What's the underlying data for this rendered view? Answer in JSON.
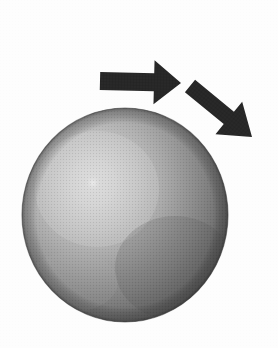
{
  "figure": {
    "title": "Shaded sphere with incoming and outgoing arrows",
    "background_color": "#fdfdfd",
    "canvas": {
      "width": 278,
      "height": 348
    }
  },
  "sphere": {
    "name": "shaded-sphere",
    "center_x": 125,
    "center_y": 215,
    "radius_x": 103,
    "radius_y": 107,
    "bounds": {
      "left": 22,
      "top": 108,
      "right": 228,
      "bottom": 322
    },
    "highlight": {
      "center_x": 93,
      "center_y": 183,
      "radius": 7,
      "color": "#e8e8e8"
    },
    "light_direction": "upper-left",
    "colors": {
      "highlight": "#d8d8d8",
      "midtone": "#9a9a9a",
      "shadow": "#6a6a6a",
      "terminator": "#4a4a4a",
      "rim": "#3c3c3c"
    },
    "texture": "halftone-screen"
  },
  "arrows": [
    {
      "name": "incoming-arrow",
      "direction": "right",
      "angle_degrees": 0,
      "color": "#262626",
      "tail_x": 100,
      "tail_y": 81,
      "tip_x": 181,
      "tip_y": 83,
      "shaft_thickness": 18,
      "head_length": 27,
      "head_width": 44,
      "label": ""
    },
    {
      "name": "outgoing-arrow",
      "direction": "down-right",
      "angle_degrees": 40,
      "color": "#262626",
      "tail_x": 190,
      "tail_y": 86,
      "tip_x": 252,
      "tip_y": 137,
      "shaft_thickness": 16,
      "head_length": 30,
      "head_width": 42,
      "label": ""
    }
  ],
  "labels": {
    "incoming": "",
    "outgoing": "",
    "object": ""
  }
}
